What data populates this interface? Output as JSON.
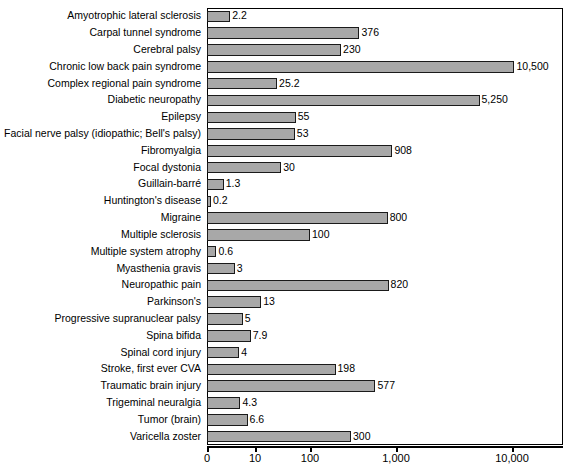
{
  "chart_data": {
    "type": "bar",
    "orientation": "horizontal",
    "title": "",
    "xlabel": "",
    "ylabel": "",
    "xscale": "log",
    "grid": false,
    "legend": null,
    "xticks": [
      "0",
      "10",
      "100",
      "1,000",
      "10,000"
    ],
    "xtick_values": [
      0,
      10,
      100,
      1000,
      10000
    ],
    "categories": [
      "Amyotrophic lateral sclerosis",
      "Carpal tunnel syndrome",
      "Cerebral palsy",
      "Chronic low back pain syndrome",
      "Complex regional pain syndrome",
      "Diabetic neuropathy",
      "Epilepsy",
      "Facial nerve palsy (idiopathic; Bell's palsy)",
      "Fibromyalgia",
      "Focal dystonia",
      "Guillain-barré",
      "Huntington's disease",
      "Migraine",
      "Multiple sclerosis",
      "Multiple system atrophy",
      "Myasthenia gravis",
      "Neuropathic pain",
      "Parkinson's",
      "Progressive supranuclear palsy",
      "Spina bifida",
      "Spinal cord injury",
      "Stroke, first ever CVA",
      "Traumatic brain injury",
      "Trigeminal neuralgia",
      "Tumor (brain)",
      "Varicella zoster"
    ],
    "values": [
      2.2,
      376,
      230,
      10500,
      25.2,
      5250,
      55,
      53,
      908,
      30,
      1.3,
      0.2,
      800,
      100,
      0.6,
      3,
      820,
      13,
      5,
      7.9,
      4,
      198,
      577,
      4.3,
      6.6,
      300
    ],
    "value_labels": [
      "2.2",
      "376",
      "230",
      "10,500",
      "25.2",
      "5,250",
      "55",
      "53",
      "908",
      "30",
      "1.3",
      "0.2",
      "800",
      "100",
      "0.6",
      "3",
      "820",
      "13",
      "5",
      "7.9",
      "4",
      "198",
      "577",
      "4.3",
      "6.6",
      "300"
    ],
    "bar_color": "#a8a8a8",
    "bar_edge_color": "#1a1a1a"
  }
}
